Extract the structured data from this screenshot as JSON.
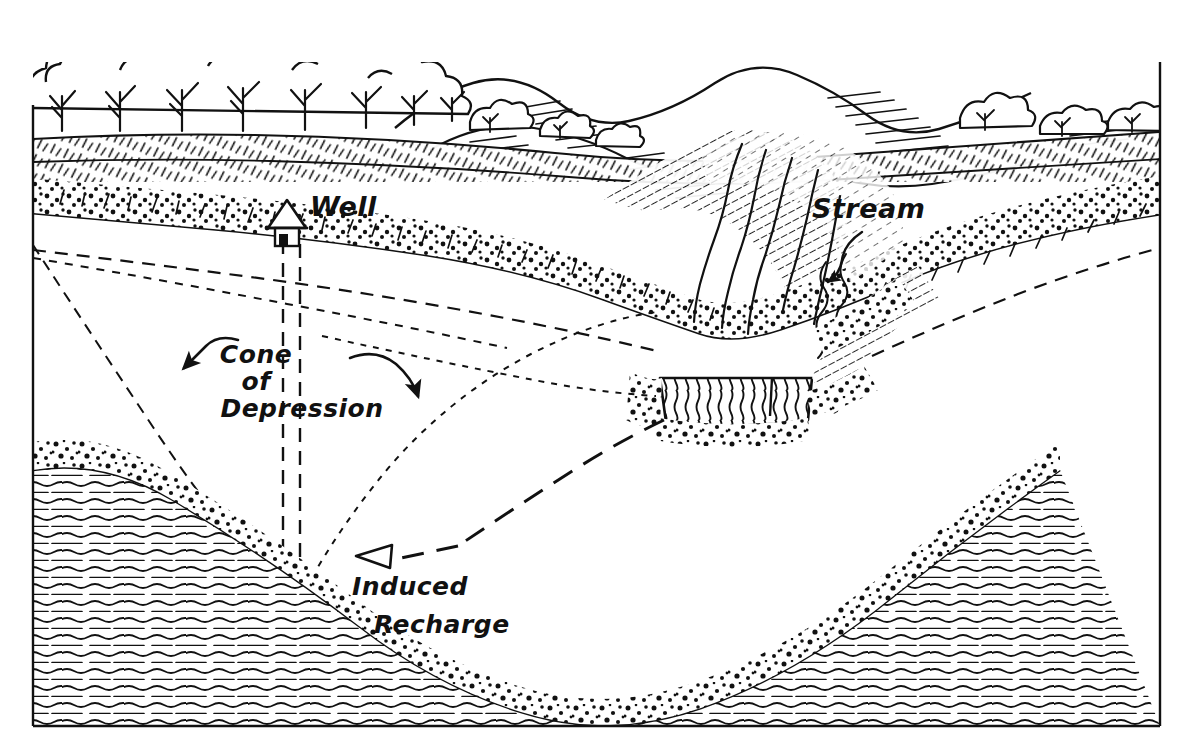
{
  "figure": {
    "type": "hydrogeologic-block-diagram",
    "background_color": "#ffffff",
    "ink_color": "#111111"
  },
  "labels": {
    "well": "Well",
    "stream": "Stream",
    "cone_line1": "Cone",
    "cone_line2": "of",
    "cone_line3": "Depression",
    "recharge_line1": "Induced",
    "recharge_line2": "Recharge"
  },
  "features": {
    "tree_line": "deciduous-tree-row",
    "hills": "rolling-hills-horizon",
    "well_house": "well-house-icon",
    "well_casing": "dashed-well-casing",
    "water_table": "dashed-water-table-line",
    "cone_of_depression": "dotted-drawdown-curve",
    "stream_channel": "hatched-stream-water",
    "alluvium": "stippled-sand-and-gravel",
    "bedrock": "wavy-line-bedrock",
    "flow_arrow": "long-dashed-induced-recharge-flowline"
  },
  "frame": {
    "left": 32,
    "right": 1160,
    "top": 105,
    "bottom": 726,
    "stroke_width": 2.4
  }
}
